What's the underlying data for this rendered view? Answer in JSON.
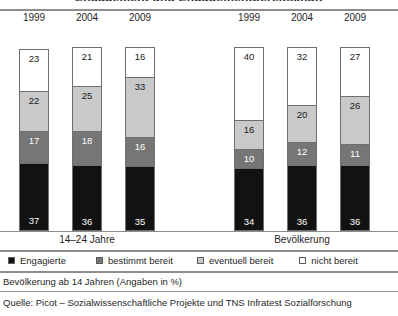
{
  "title_remnant": "Engagement und Engagementbereitschaft",
  "groups": [
    {
      "name": "14–24 Jahre",
      "label": "14–24 Jahre",
      "center_x": 87,
      "years": [
        "1999",
        "2004",
        "2009"
      ]
    },
    {
      "name": "Bevölkerung",
      "label": "Bevölkerung",
      "center_x": 302,
      "years": [
        "1999",
        "2004",
        "2009"
      ]
    }
  ],
  "legend": {
    "items": [
      {
        "label": "Engagierte",
        "color": "#121212",
        "key": "engagierte"
      },
      {
        "label": "bestimmt bereit",
        "color": "#767676",
        "key": "bestimmt_bereit"
      },
      {
        "label": "eventuell bereit",
        "color": "#c9c9c9",
        "key": "eventuell_bereit"
      },
      {
        "label": "nicht bereit",
        "color": "#ffffff",
        "key": "nicht_bereit"
      }
    ]
  },
  "note": "Bevölkerung ab 14 Jahren (Angaben in %)",
  "source": "Quelle: Picot – Sozialwissenschaftliche Projekte und TNS Infratest Sozialforschung",
  "chart_data": {
    "type": "bar",
    "subtype": "stacked-column",
    "title": "Engagement und Engagementbereitschaft",
    "xlabel": "",
    "ylabel": "",
    "ylim": [
      0,
      100
    ],
    "unit": "%",
    "grid": false,
    "legend_position": "bottom",
    "categories": [
      "14–24 Jahre 1999",
      "14–24 Jahre 2004",
      "14–24 Jahre 2009",
      "Bevölkerung 1999",
      "Bevölkerung 2004",
      "Bevölkerung 2009"
    ],
    "series": [
      {
        "name": "Engagierte",
        "color": "#121212",
        "values": [
          37,
          36,
          35,
          34,
          36,
          36
        ]
      },
      {
        "name": "bestimmt bereit",
        "color": "#767676",
        "values": [
          17,
          18,
          16,
          10,
          12,
          11
        ]
      },
      {
        "name": "eventuell bereit",
        "color": "#c9c9c9",
        "values": [
          22,
          25,
          33,
          16,
          20,
          26
        ]
      },
      {
        "name": "nicht bereit",
        "color": "#ffffff",
        "values": [
          23,
          21,
          16,
          40,
          32,
          27
        ]
      }
    ],
    "bars": [
      {
        "group": "14–24 Jahre",
        "year": "1999",
        "x": 19,
        "stack": [
          {
            "key": "engagierte",
            "label": "Engagierte",
            "value": 37,
            "color": "#121212"
          },
          {
            "key": "bestimmt_bereit",
            "label": "bestimmt bereit",
            "value": 17,
            "color": "#767676"
          },
          {
            "key": "eventuell_bereit",
            "label": "eventuell bereit",
            "value": 22,
            "color": "#c9c9c9"
          },
          {
            "key": "nicht_bereit",
            "label": "nicht bereit",
            "value": 23,
            "color": "#ffffff"
          }
        ]
      },
      {
        "group": "14–24 Jahre",
        "year": "2004",
        "x": 72,
        "stack": [
          {
            "key": "engagierte",
            "label": "Engagierte",
            "value": 36,
            "color": "#121212"
          },
          {
            "key": "bestimmt_bereit",
            "label": "bestimmt bereit",
            "value": 18,
            "color": "#767676"
          },
          {
            "key": "eventuell_bereit",
            "label": "eventuell bereit",
            "value": 25,
            "color": "#c9c9c9"
          },
          {
            "key": "nicht_bereit",
            "label": "nicht bereit",
            "value": 21,
            "color": "#ffffff"
          }
        ]
      },
      {
        "group": "14–24 Jahre",
        "year": "2009",
        "x": 125,
        "stack": [
          {
            "key": "engagierte",
            "label": "Engagierte",
            "value": 35,
            "color": "#121212"
          },
          {
            "key": "bestimmt_bereit",
            "label": "bestimmt bereit",
            "value": 16,
            "color": "#767676"
          },
          {
            "key": "eventuell_bereit",
            "label": "eventuell bereit",
            "value": 33,
            "color": "#c9c9c9"
          },
          {
            "key": "nicht_bereit",
            "label": "nicht bereit",
            "value": 16,
            "color": "#ffffff"
          }
        ]
      },
      {
        "group": "Bevölkerung",
        "year": "1999",
        "x": 234,
        "stack": [
          {
            "key": "engagierte",
            "label": "Engagierte",
            "value": 34,
            "color": "#121212"
          },
          {
            "key": "bestimmt_bereit",
            "label": "bestimmt bereit",
            "value": 10,
            "color": "#767676"
          },
          {
            "key": "eventuell_bereit",
            "label": "eventuell bereit",
            "value": 16,
            "color": "#c9c9c9"
          },
          {
            "key": "nicht_bereit",
            "label": "nicht bereit",
            "value": 40,
            "color": "#ffffff"
          }
        ]
      },
      {
        "group": "Bevölkerung",
        "year": "2004",
        "x": 287,
        "stack": [
          {
            "key": "engagierte",
            "label": "Engagierte",
            "value": 36,
            "color": "#121212"
          },
          {
            "key": "bestimmt_bereit",
            "label": "bestimmt bereit",
            "value": 12,
            "color": "#767676"
          },
          {
            "key": "eventuell_bereit",
            "label": "eventuell bereit",
            "value": 20,
            "color": "#c9c9c9"
          },
          {
            "key": "nicht_bereit",
            "label": "nicht bereit",
            "value": 32,
            "color": "#ffffff"
          }
        ]
      },
      {
        "group": "Bevölkerung",
        "year": "2009",
        "x": 340,
        "stack": [
          {
            "key": "engagierte",
            "label": "Engagierte",
            "value": 36,
            "color": "#121212"
          },
          {
            "key": "bestimmt_bereit",
            "label": "bestimmt bereit",
            "value": 11,
            "color": "#767676"
          },
          {
            "key": "eventuell_bereit",
            "label": "eventuell bereit",
            "value": 26,
            "color": "#c9c9c9"
          },
          {
            "key": "nicht_bereit",
            "label": "nicht bereit",
            "value": 27,
            "color": "#ffffff"
          }
        ]
      }
    ]
  }
}
